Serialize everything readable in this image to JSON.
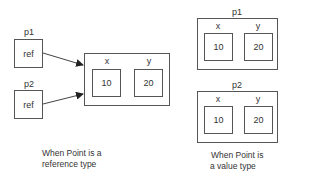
{
  "reference_diagram": {
    "variables": [
      {
        "name": "p1",
        "content": "ref"
      },
      {
        "name": "p2",
        "content": "ref"
      }
    ],
    "object": {
      "fields": [
        {
          "name": "x",
          "value": "10"
        },
        {
          "name": "y",
          "value": "20"
        }
      ]
    },
    "caption_line1": "When Point is a",
    "caption_line2": "reference type"
  },
  "value_diagram": {
    "variables": [
      {
        "name": "p1",
        "fields": [
          {
            "name": "x",
            "value": "10"
          },
          {
            "name": "y",
            "value": "20"
          }
        ]
      },
      {
        "name": "p2",
        "fields": [
          {
            "name": "x",
            "value": "10"
          },
          {
            "name": "y",
            "value": "20"
          }
        ]
      }
    ],
    "caption_line1": "When Point is",
    "caption_line2": "a value type"
  },
  "colors": {
    "stroke": "#555555",
    "text": "#333333",
    "background": "#ffffff"
  }
}
